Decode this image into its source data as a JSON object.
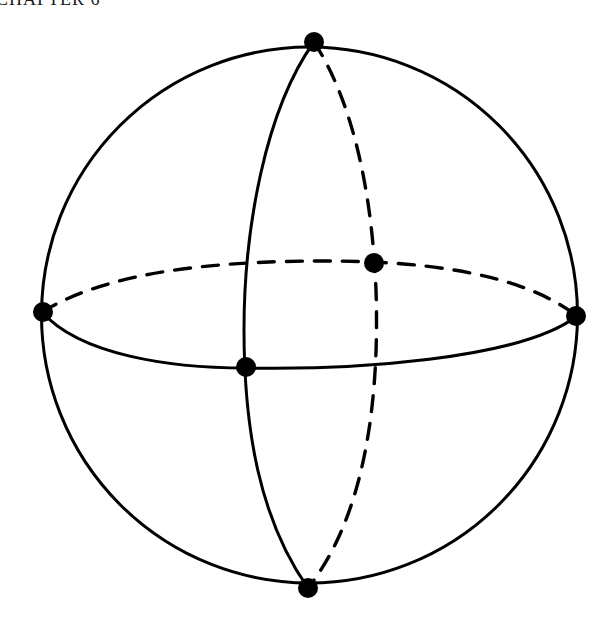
{
  "page": {
    "header": "CHAPTER 6"
  },
  "figure": {
    "type": "sphere-with-great-circles",
    "sphere": {
      "cx": 309,
      "cy": 315,
      "r": 268
    },
    "equator": {
      "left": [
        42,
        312
      ],
      "right": [
        577,
        316
      ],
      "front_style": "solid",
      "back_style": "dashed"
    },
    "meridian": {
      "top": [
        314,
        42
      ],
      "bottom": [
        308,
        588
      ],
      "front_style": "solid",
      "back_style": "dashed"
    },
    "points": [
      {
        "name": "north-pole",
        "x": 314,
        "y": 42
      },
      {
        "name": "south-pole",
        "x": 308,
        "y": 588
      },
      {
        "name": "equator-left",
        "x": 42,
        "y": 312
      },
      {
        "name": "equator-right",
        "x": 577,
        "y": 316
      },
      {
        "name": "front-intersection",
        "x": 246,
        "y": 367
      },
      {
        "name": "back-intersection",
        "x": 374,
        "y": 263
      }
    ],
    "colors": {
      "line": "#000000",
      "background": "#ffffff"
    }
  }
}
